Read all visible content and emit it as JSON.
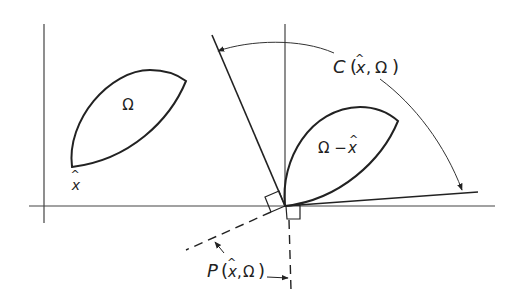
{
  "diagram": {
    "type": "geometric-figure",
    "stroke_color": "#222222",
    "background": "#ffffff",
    "labels": {
      "omega": "Ω",
      "x_hat_symbol": "x",
      "hat": "^",
      "omega_minus_x": "Ω −",
      "cone_label": "C (x̂, Ω)",
      "cone_label_parts": {
        "name": "C",
        "open": "(",
        "x": "x",
        "sep": ",",
        "omega": "Ω",
        "close": ")"
      },
      "polar_label": "P(x̂, Ω)",
      "polar_label_parts": {
        "name": "P",
        "open": "(",
        "x": "x",
        "sep": ",",
        "omega": "Ω",
        "close": ")"
      }
    },
    "elements": [
      {
        "id": "left-axes",
        "description": "Coordinate axes with set Ω and point x̂"
      },
      {
        "id": "right-axes",
        "description": "Translated set Ω − x̂ at origin with tangent cone C(x̂, Ω)"
      },
      {
        "id": "polar-cone",
        "description": "Dashed polar cone P(x̂, Ω) perpendicular to cone boundaries"
      }
    ]
  }
}
